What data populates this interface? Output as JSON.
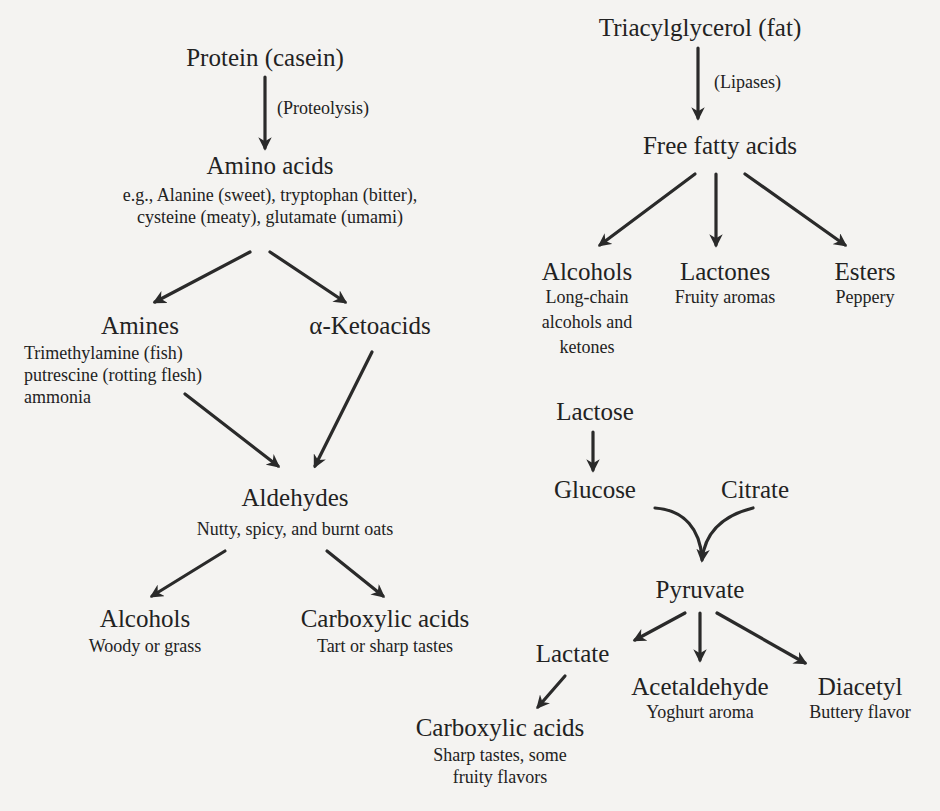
{
  "diagram": {
    "protein_branch": {
      "protein": {
        "label": "Protein (casein)"
      },
      "proteolysis": {
        "label": "(Proteolysis)"
      },
      "amino_acids": {
        "label": "Amino acids",
        "desc_line1": "e.g., Alanine (sweet), tryptophan (bitter),",
        "desc_line2": "cysteine (meaty), glutamate (umami)"
      },
      "amines": {
        "label": "Amines",
        "desc_line1": "Trimethylamine (fish)",
        "desc_line2": "putrescine (rotting flesh)",
        "desc_line3": "ammonia"
      },
      "ketoacids": {
        "label": "α-Ketoacids"
      },
      "aldehydes": {
        "label": "Aldehydes",
        "desc": "Nutty, spicy, and burnt oats"
      },
      "alcohols": {
        "label": "Alcohols",
        "desc": "Woody or grass"
      },
      "carboxylic_acids": {
        "label": "Carboxylic acids",
        "desc": "Tart or sharp tastes"
      }
    },
    "fat_branch": {
      "triacylglycerol": {
        "label": "Triacylglycerol (fat)"
      },
      "lipases": {
        "label": "(Lipases)"
      },
      "free_fatty_acids": {
        "label": "Free fatty acids"
      },
      "alcohols": {
        "label": "Alcohols",
        "desc_line1": "Long-chain",
        "desc_line2": "alcohols and",
        "desc_line3": "ketones"
      },
      "lactones": {
        "label": "Lactones",
        "desc": "Fruity aromas"
      },
      "esters": {
        "label": "Esters",
        "desc": "Peppery"
      }
    },
    "lactose_branch": {
      "lactose": {
        "label": "Lactose"
      },
      "glucose": {
        "label": "Glucose"
      },
      "citrate": {
        "label": "Citrate"
      },
      "pyruvate": {
        "label": "Pyruvate"
      },
      "lactate": {
        "label": "Lactate"
      },
      "acetaldehyde": {
        "label": "Acetaldehyde",
        "desc": "Yoghurt aroma"
      },
      "diacetyl": {
        "label": "Diacetyl",
        "desc": "Buttery flavor"
      },
      "carboxylic_acids": {
        "label": "Carboxylic acids",
        "desc_line1": "Sharp tastes, some",
        "desc_line2": "fruity flavors"
      }
    },
    "colors": {
      "background": "#f4f3f1",
      "ink": "#222222",
      "arrow": "#2a2a2a"
    }
  }
}
